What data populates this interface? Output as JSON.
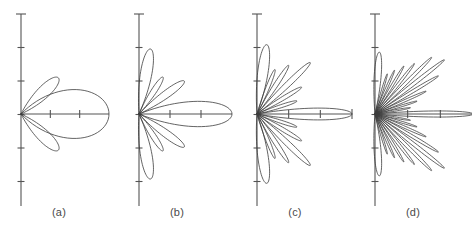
{
  "figure": {
    "caption_labels": [
      "(a)",
      "(b)",
      "(c)",
      "(d)"
    ],
    "background_color": "#ffffff",
    "line_color": "#3c3c3c",
    "axis_color": "#545454",
    "label_color": "#4a4a4a"
  },
  "chart_data": {
    "type": "line",
    "title": "",
    "subtitle": "",
    "xlabel": "",
    "ylabel": "",
    "plot_style": "polar-radiation-pattern",
    "grid": false,
    "legend": "none",
    "panel_count": 4,
    "panels": [
      {
        "label": "(a)",
        "index": 0,
        "description": "Broad main lobe with one upper and one lower sidelobe",
        "main_lobe_half_beamwidth_deg": 46,
        "main_lobe_radius_px": 88,
        "sidelobe_count_per_side": 1,
        "vertical_axis_tick_count": 7,
        "horizontal_axis_tick_count": 2,
        "has_axis_end_cap": false,
        "nulls_deg": [
          62,
          118
        ],
        "lobes": [
          {
            "center_deg": 0,
            "half_width_deg": 46,
            "radius_px": 88
          },
          {
            "center_deg": 44,
            "half_width_deg": 19,
            "radius_px": 52
          },
          {
            "center_deg": -44,
            "half_width_deg": 19,
            "radius_px": 52
          }
        ]
      },
      {
        "label": "(b)",
        "index": 1,
        "description": "Narrower main lobe, three sidelobes per side plus broad back lobes near 90 degrees",
        "main_lobe_half_beamwidth_deg": 22,
        "main_lobe_radius_px": 93,
        "sidelobe_count_per_side": 3,
        "vertical_axis_tick_count": 7,
        "horizontal_axis_tick_count": 2,
        "has_axis_end_cap": false,
        "nulls_deg": [
          26,
          48,
          68,
          88
        ],
        "lobes": [
          {
            "center_deg": 0,
            "half_width_deg": 22,
            "radius_px": 93
          },
          {
            "center_deg": 36,
            "half_width_deg": 11,
            "radius_px": 56
          },
          {
            "center_deg": -36,
            "half_width_deg": 11,
            "radius_px": 56
          },
          {
            "center_deg": 57,
            "half_width_deg": 10,
            "radius_px": 44
          },
          {
            "center_deg": -57,
            "half_width_deg": 10,
            "radius_px": 44
          },
          {
            "center_deg": 80,
            "half_width_deg": 14,
            "radius_px": 66
          },
          {
            "center_deg": -80,
            "half_width_deg": 14,
            "radius_px": 66
          }
        ]
      },
      {
        "label": "(c)",
        "index": 2,
        "description": "Pencil main lobe with six sidelobes per side and large broad lobes near 90 degrees",
        "main_lobe_half_beamwidth_deg": 10,
        "main_lobe_radius_px": 95,
        "sidelobe_count_per_side": 6,
        "vertical_axis_tick_count": 7,
        "horizontal_axis_tick_count": 2,
        "has_axis_end_cap": true,
        "nulls_deg": [
          12,
          24,
          36,
          48,
          60,
          72,
          84
        ],
        "lobes": [
          {
            "center_deg": 0,
            "half_width_deg": 10,
            "radius_px": 95
          },
          {
            "center_deg": 18,
            "half_width_deg": 6,
            "radius_px": 42
          },
          {
            "center_deg": -18,
            "half_width_deg": 6,
            "radius_px": 42
          },
          {
            "center_deg": 31,
            "half_width_deg": 6,
            "radius_px": 52
          },
          {
            "center_deg": -31,
            "half_width_deg": 6,
            "radius_px": 52
          },
          {
            "center_deg": 44,
            "half_width_deg": 6,
            "radius_px": 74
          },
          {
            "center_deg": -44,
            "half_width_deg": 6,
            "radius_px": 74
          },
          {
            "center_deg": 57,
            "half_width_deg": 6,
            "radius_px": 58
          },
          {
            "center_deg": -57,
            "half_width_deg": 6,
            "radius_px": 58
          },
          {
            "center_deg": 68,
            "half_width_deg": 6,
            "radius_px": 48
          },
          {
            "center_deg": -68,
            "half_width_deg": 6,
            "radius_px": 48
          },
          {
            "center_deg": 82,
            "half_width_deg": 12,
            "radius_px": 70
          },
          {
            "center_deg": -82,
            "half_width_deg": 12,
            "radius_px": 70
          }
        ]
      },
      {
        "label": "(d)",
        "index": 3,
        "description": "Very narrow main lobe with many closely spaced sidelobes filling the half plane",
        "main_lobe_half_beamwidth_deg": 5,
        "main_lobe_radius_px": 98,
        "sidelobe_count_per_side": 11,
        "vertical_axis_tick_count": 7,
        "horizontal_axis_tick_count": 2,
        "has_axis_end_cap": true,
        "nulls_deg": [
          6,
          13,
          20,
          27,
          34,
          41,
          48,
          55,
          62,
          69,
          76,
          83
        ],
        "lobes": [
          {
            "center_deg": 0,
            "half_width_deg": 5,
            "radius_px": 98
          },
          {
            "center_deg": 10,
            "half_width_deg": 3.2,
            "radius_px": 36
          },
          {
            "center_deg": -10,
            "half_width_deg": 3.2,
            "radius_px": 36
          },
          {
            "center_deg": 17,
            "half_width_deg": 3.2,
            "radius_px": 44
          },
          {
            "center_deg": -17,
            "half_width_deg": 3.2,
            "radius_px": 44
          },
          {
            "center_deg": 24,
            "half_width_deg": 3.2,
            "radius_px": 56
          },
          {
            "center_deg": -24,
            "half_width_deg": 3.2,
            "radius_px": 56
          },
          {
            "center_deg": 31,
            "half_width_deg": 3.2,
            "radius_px": 74
          },
          {
            "center_deg": -31,
            "half_width_deg": 3.2,
            "radius_px": 74
          },
          {
            "center_deg": 38,
            "half_width_deg": 3.2,
            "radius_px": 88
          },
          {
            "center_deg": -38,
            "half_width_deg": 3.2,
            "radius_px": 88
          },
          {
            "center_deg": 45,
            "half_width_deg": 3.2,
            "radius_px": 80
          },
          {
            "center_deg": -45,
            "half_width_deg": 3.2,
            "radius_px": 80
          },
          {
            "center_deg": 52,
            "half_width_deg": 3.2,
            "radius_px": 64
          },
          {
            "center_deg": -52,
            "half_width_deg": 3.2,
            "radius_px": 64
          },
          {
            "center_deg": 59,
            "half_width_deg": 3.2,
            "radius_px": 56
          },
          {
            "center_deg": -59,
            "half_width_deg": 3.2,
            "radius_px": 56
          },
          {
            "center_deg": 66,
            "half_width_deg": 3.2,
            "radius_px": 48
          },
          {
            "center_deg": -66,
            "half_width_deg": 3.2,
            "radius_px": 48
          },
          {
            "center_deg": 73,
            "half_width_deg": 3.2,
            "radius_px": 42
          },
          {
            "center_deg": -73,
            "half_width_deg": 3.2,
            "radius_px": 42
          },
          {
            "center_deg": 86,
            "half_width_deg": 9,
            "radius_px": 62
          },
          {
            "center_deg": -86,
            "half_width_deg": 9,
            "radius_px": 62
          }
        ]
      }
    ]
  }
}
